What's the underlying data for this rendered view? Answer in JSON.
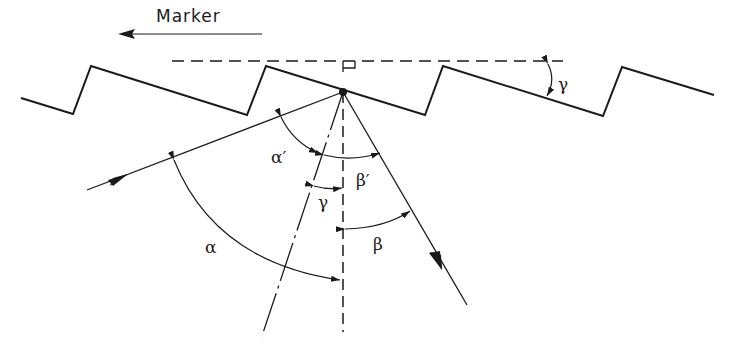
{
  "diagram": {
    "title": "Marker",
    "labels": {
      "alpha": "α",
      "alpha_prime": "α′",
      "beta": "β",
      "beta_prime": "β′",
      "gamma_top": "γ",
      "gamma_mid": "γ"
    },
    "elements": [
      {
        "id": "marker-arrow",
        "type": "arrow",
        "direction": "left"
      },
      {
        "id": "grating-sawtooth",
        "type": "polyline"
      },
      {
        "id": "horizontal-reference",
        "type": "dashed-line"
      },
      {
        "id": "grating-normal",
        "type": "dashed-line",
        "orientation": "vertical"
      },
      {
        "id": "facet-normal",
        "type": "dash-dot-line"
      },
      {
        "id": "incident-ray",
        "type": "arrow-line"
      },
      {
        "id": "diffracted-ray",
        "type": "arrow-line"
      },
      {
        "id": "right-angle-marker",
        "type": "symbol"
      }
    ],
    "colors": {
      "stroke": "#1a1a1a",
      "background": "#ffffff"
    }
  }
}
